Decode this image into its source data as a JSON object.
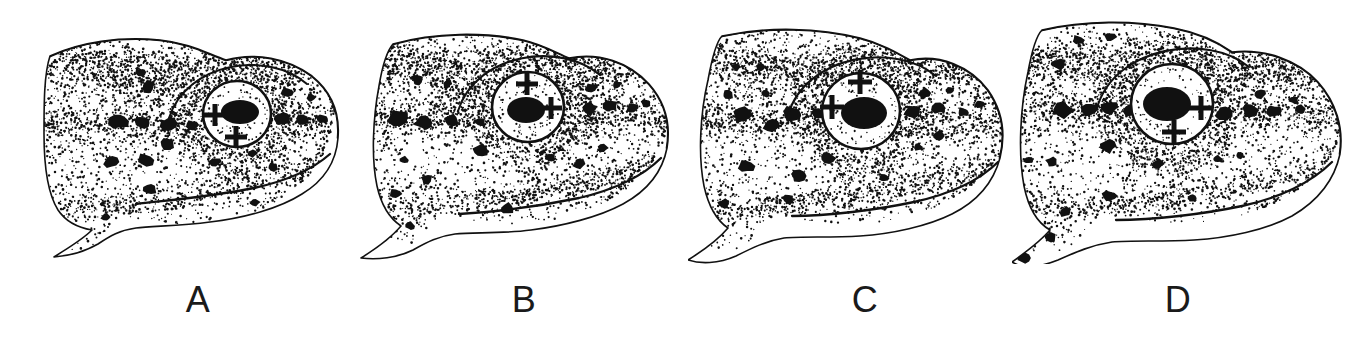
{
  "figure": {
    "kind": "scientific-plate",
    "background_color": "#ffffff",
    "ink_color": "#111111",
    "canvas": {
      "width": 1358,
      "height": 346
    },
    "panel_count": 4
  },
  "panels": [
    {
      "label": "A",
      "label_x": 198,
      "label_y": 282,
      "origin_x": 40,
      "origin_y": 14,
      "width": 300,
      "height": 250,
      "snout_shape": "pointed",
      "eye": {
        "cx": 197,
        "cy": 100,
        "rx": 34,
        "ry": 33,
        "pupil_cx": 200,
        "pupil_cy": 98,
        "pupil_rx": 19,
        "pupil_ry": 12,
        "crosshairs": [
          {
            "x": 175,
            "y": 101,
            "size": 11,
            "thickness": 4
          },
          {
            "x": 196,
            "y": 123,
            "size": 11,
            "thickness": 4
          }
        ]
      },
      "spots": [
        {
          "x": 108,
          "y": 73,
          "r": 6
        },
        {
          "x": 101,
          "y": 58,
          "r": 4
        },
        {
          "x": 79,
          "y": 107,
          "r": 8
        },
        {
          "x": 103,
          "y": 109,
          "r": 7
        },
        {
          "x": 129,
          "y": 110,
          "r": 7
        },
        {
          "x": 152,
          "y": 111,
          "r": 5
        },
        {
          "x": 242,
          "y": 104,
          "r": 7
        },
        {
          "x": 262,
          "y": 106,
          "r": 6
        },
        {
          "x": 283,
          "y": 105,
          "r": 5
        },
        {
          "x": 247,
          "y": 78,
          "r": 5
        },
        {
          "x": 271,
          "y": 83,
          "r": 4
        },
        {
          "x": 297,
          "y": 96,
          "r": 3
        },
        {
          "x": 128,
          "y": 130,
          "r": 6
        },
        {
          "x": 105,
          "y": 146,
          "r": 7
        },
        {
          "x": 71,
          "y": 148,
          "r": 6
        },
        {
          "x": 175,
          "y": 148,
          "r": 5
        },
        {
          "x": 212,
          "y": 140,
          "r": 4
        },
        {
          "x": 233,
          "y": 153,
          "r": 5
        },
        {
          "x": 110,
          "y": 175,
          "r": 6
        },
        {
          "x": 66,
          "y": 203,
          "r": 4
        },
        {
          "x": 215,
          "y": 188,
          "r": 4
        }
      ]
    },
    {
      "label": "B",
      "label_x": 524,
      "label_y": 282,
      "origin_x": 355,
      "origin_y": 14,
      "width": 320,
      "height": 250,
      "snout_shape": "angular",
      "eye": {
        "cx": 173,
        "cy": 93,
        "rx": 36,
        "ry": 35,
        "pupil_cx": 171,
        "pupil_cy": 96,
        "pupil_rx": 19,
        "pupil_ry": 13,
        "crosshairs": [
          {
            "x": 172,
            "y": 70,
            "size": 11,
            "thickness": 4
          },
          {
            "x": 196,
            "y": 94,
            "size": 11,
            "thickness": 4
          }
        ]
      },
      "spots": [
        {
          "x": 63,
          "y": 66,
          "r": 5
        },
        {
          "x": 92,
          "y": 70,
          "r": 4
        },
        {
          "x": 44,
          "y": 104,
          "r": 9
        },
        {
          "x": 69,
          "y": 108,
          "r": 8
        },
        {
          "x": 97,
          "y": 106,
          "r": 6
        },
        {
          "x": 125,
          "y": 108,
          "r": 5
        },
        {
          "x": 234,
          "y": 94,
          "r": 7
        },
        {
          "x": 256,
          "y": 92,
          "r": 6
        },
        {
          "x": 278,
          "y": 94,
          "r": 5
        },
        {
          "x": 236,
          "y": 74,
          "r": 5
        },
        {
          "x": 262,
          "y": 71,
          "r": 4
        },
        {
          "x": 291,
          "y": 89,
          "r": 4
        },
        {
          "x": 126,
          "y": 137,
          "r": 7
        },
        {
          "x": 72,
          "y": 165,
          "r": 5
        },
        {
          "x": 40,
          "y": 180,
          "r": 5
        },
        {
          "x": 196,
          "y": 143,
          "r": 4
        },
        {
          "x": 224,
          "y": 150,
          "r": 5
        },
        {
          "x": 248,
          "y": 134,
          "r": 4
        },
        {
          "x": 152,
          "y": 195,
          "r": 6
        },
        {
          "x": 55,
          "y": 212,
          "r": 4
        },
        {
          "x": 49,
          "y": 146,
          "r": 4
        }
      ]
    },
    {
      "label": "C",
      "label_x": 865,
      "label_y": 282,
      "origin_x": 688,
      "origin_y": 14,
      "width": 330,
      "height": 250,
      "snout_shape": "rounded-angular",
      "eye": {
        "cx": 173,
        "cy": 97,
        "rx": 39,
        "ry": 38,
        "pupil_cx": 176,
        "pupil_cy": 99,
        "pupil_rx": 23,
        "pupil_ry": 16,
        "crosshairs": [
          {
            "x": 172,
            "y": 68,
            "size": 12,
            "thickness": 4
          },
          {
            "x": 144,
            "y": 93,
            "size": 12,
            "thickness": 4
          }
        ]
      },
      "spots": [
        {
          "x": 48,
          "y": 53,
          "r": 4
        },
        {
          "x": 72,
          "y": 53,
          "r": 4
        },
        {
          "x": 40,
          "y": 81,
          "r": 5
        },
        {
          "x": 78,
          "y": 80,
          "r": 4
        },
        {
          "x": 55,
          "y": 100,
          "r": 9
        },
        {
          "x": 83,
          "y": 112,
          "r": 7
        },
        {
          "x": 104,
          "y": 100,
          "r": 8
        },
        {
          "x": 130,
          "y": 100,
          "r": 6
        },
        {
          "x": 225,
          "y": 98,
          "r": 7
        },
        {
          "x": 251,
          "y": 94,
          "r": 6
        },
        {
          "x": 275,
          "y": 98,
          "r": 5
        },
        {
          "x": 236,
          "y": 79,
          "r": 5
        },
        {
          "x": 262,
          "y": 76,
          "r": 4
        },
        {
          "x": 292,
          "y": 90,
          "r": 4
        },
        {
          "x": 250,
          "y": 122,
          "r": 5
        },
        {
          "x": 140,
          "y": 144,
          "r": 6
        },
        {
          "x": 58,
          "y": 152,
          "r": 7
        },
        {
          "x": 110,
          "y": 162,
          "r": 6
        },
        {
          "x": 100,
          "y": 185,
          "r": 5
        },
        {
          "x": 36,
          "y": 190,
          "r": 5
        },
        {
          "x": 18,
          "y": 192,
          "r": 4
        },
        {
          "x": 230,
          "y": 133,
          "r": 4
        },
        {
          "x": 196,
          "y": 164,
          "r": 4
        },
        {
          "x": 22,
          "y": 218,
          "r": 4
        }
      ]
    },
    {
      "label": "D",
      "label_x": 1178,
      "label_y": 282,
      "origin_x": 1012,
      "origin_y": 12,
      "width": 340,
      "height": 252,
      "snout_shape": "blunt-rounded",
      "eye": {
        "cx": 160,
        "cy": 92,
        "rx": 41,
        "ry": 40,
        "pupil_cx": 155,
        "pupil_cy": 92,
        "pupil_rx": 24,
        "pupil_ry": 17,
        "crosshairs": [
          {
            "x": 189,
            "y": 96,
            "size": 12,
            "thickness": 4
          },
          {
            "x": 162,
            "y": 120,
            "size": 12,
            "thickness": 4
          }
        ]
      },
      "spots": [
        {
          "x": 47,
          "y": 52,
          "r": 6
        },
        {
          "x": 66,
          "y": 28,
          "r": 5
        },
        {
          "x": 98,
          "y": 25,
          "r": 5
        },
        {
          "x": 50,
          "y": 98,
          "r": 9
        },
        {
          "x": 78,
          "y": 98,
          "r": 7
        },
        {
          "x": 98,
          "y": 95,
          "r": 7
        },
        {
          "x": 118,
          "y": 99,
          "r": 6
        },
        {
          "x": 212,
          "y": 101,
          "r": 7
        },
        {
          "x": 238,
          "y": 98,
          "r": 7
        },
        {
          "x": 262,
          "y": 99,
          "r": 6
        },
        {
          "x": 288,
          "y": 97,
          "r": 5
        },
        {
          "x": 248,
          "y": 82,
          "r": 5
        },
        {
          "x": 282,
          "y": 88,
          "r": 4
        },
        {
          "x": 96,
          "y": 134,
          "r": 7
        },
        {
          "x": 40,
          "y": 150,
          "r": 5
        },
        {
          "x": 146,
          "y": 152,
          "r": 5
        },
        {
          "x": 205,
          "y": 147,
          "r": 4
        },
        {
          "x": 228,
          "y": 143,
          "r": 4
        },
        {
          "x": 98,
          "y": 184,
          "r": 6
        },
        {
          "x": 53,
          "y": 200,
          "r": 5
        },
        {
          "x": 38,
          "y": 226,
          "r": 5
        },
        {
          "x": 16,
          "y": 148,
          "r": 4
        },
        {
          "x": 12,
          "y": 246,
          "r": 5
        },
        {
          "x": 180,
          "y": 186,
          "r": 4
        }
      ]
    }
  ]
}
